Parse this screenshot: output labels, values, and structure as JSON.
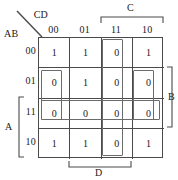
{
  "diagram": {
    "type": "karnaugh-map",
    "variables": [
      "A",
      "B",
      "C",
      "D"
    ],
    "corner": {
      "column_vars": "CD",
      "row_vars": "AB"
    },
    "column_headers": [
      "00",
      "01",
      "11",
      "10"
    ],
    "row_headers": [
      "00",
      "01",
      "11",
      "10"
    ],
    "cells": [
      [
        "1",
        "1",
        "0",
        "1"
      ],
      [
        "0",
        "1",
        "0",
        "0"
      ],
      [
        "0",
        "0",
        "0",
        "0"
      ],
      [
        "1",
        "1",
        "0",
        "1"
      ]
    ],
    "brackets": [
      {
        "label": "C",
        "side": "top",
        "covers": [
          "11",
          "10"
        ]
      },
      {
        "label": "B",
        "side": "right",
        "covers": [
          "01",
          "11"
        ]
      },
      {
        "label": "D",
        "side": "bottom",
        "covers": [
          "01",
          "11"
        ]
      },
      {
        "label": "A",
        "side": "left",
        "covers": [
          "11",
          "10"
        ]
      }
    ],
    "groups": [
      {
        "name": "column-11-all-rows",
        "cols": [
          2,
          2
        ],
        "rows": [
          0,
          3
        ]
      },
      {
        "name": "row-11-all-cols",
        "cols": [
          0,
          3
        ],
        "rows": [
          2,
          2
        ]
      },
      {
        "name": "column-00-rows-01-11",
        "cols": [
          0,
          0
        ],
        "rows": [
          1,
          2
        ]
      },
      {
        "name": "column-10-rows-01-11",
        "cols": [
          3,
          3
        ],
        "rows": [
          1,
          2
        ]
      }
    ]
  }
}
